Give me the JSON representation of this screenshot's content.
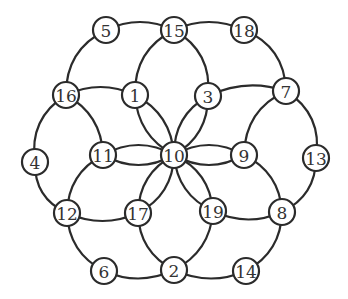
{
  "diagram": {
    "type": "graph",
    "node_radius": 13,
    "colors": {
      "stroke": "#2b2b2b",
      "fill": "#ffffff",
      "label": "#333333"
    },
    "nodes": [
      {
        "id": "1",
        "x": 135,
        "y": 95
      },
      {
        "id": "2",
        "x": 174,
        "y": 270
      },
      {
        "id": "3",
        "x": 208,
        "y": 96
      },
      {
        "id": "4",
        "x": 35,
        "y": 162
      },
      {
        "id": "5",
        "x": 106,
        "y": 30
      },
      {
        "id": "6",
        "x": 104,
        "y": 271
      },
      {
        "id": "7",
        "x": 286,
        "y": 91
      },
      {
        "id": "8",
        "x": 282,
        "y": 212
      },
      {
        "id": "9",
        "x": 244,
        "y": 155
      },
      {
        "id": "10",
        "x": 174,
        "y": 155
      },
      {
        "id": "11",
        "x": 103,
        "y": 155
      },
      {
        "id": "12",
        "x": 67,
        "y": 213
      },
      {
        "id": "13",
        "x": 316,
        "y": 158
      },
      {
        "id": "14",
        "x": 246,
        "y": 271
      },
      {
        "id": "15",
        "x": 174,
        "y": 30
      },
      {
        "id": "16",
        "x": 66,
        "y": 95
      },
      {
        "id": "17",
        "x": 138,
        "y": 213
      },
      {
        "id": "18",
        "x": 244,
        "y": 30
      },
      {
        "id": "19",
        "x": 213,
        "y": 211
      }
    ],
    "edges": [
      {
        "from": "5",
        "to": "15",
        "bend": -8
      },
      {
        "from": "15",
        "to": "18",
        "bend": -8
      },
      {
        "from": "5",
        "to": "16",
        "bend": 12
      },
      {
        "from": "15",
        "to": "1",
        "bend": 12
      },
      {
        "from": "15",
        "to": "3",
        "bend": -12
      },
      {
        "from": "18",
        "to": "7",
        "bend": -12
      },
      {
        "from": "16",
        "to": "1",
        "bend": -8
      },
      {
        "from": "3",
        "to": "7",
        "bend": -8
      },
      {
        "from": "16",
        "to": "4",
        "bend": 12
      },
      {
        "from": "16",
        "to": "11",
        "bend": -10
      },
      {
        "from": "7",
        "to": "13",
        "bend": -12
      },
      {
        "from": "7",
        "to": "9",
        "bend": 12
      },
      {
        "from": "1",
        "to": "10",
        "bend": 10
      },
      {
        "from": "1",
        "to": "10",
        "bend": -10
      },
      {
        "from": "3",
        "to": "10",
        "bend": 10
      },
      {
        "from": "3",
        "to": "10",
        "bend": -10
      },
      {
        "from": "11",
        "to": "10",
        "bend": 10
      },
      {
        "from": "11",
        "to": "10",
        "bend": -10
      },
      {
        "from": "9",
        "to": "10",
        "bend": 10
      },
      {
        "from": "9",
        "to": "10",
        "bend": -10
      },
      {
        "from": "17",
        "to": "10",
        "bend": 10
      },
      {
        "from": "17",
        "to": "10",
        "bend": -10
      },
      {
        "from": "19",
        "to": "10",
        "bend": 10
      },
      {
        "from": "19",
        "to": "10",
        "bend": -10
      },
      {
        "from": "4",
        "to": "12",
        "bend": 10
      },
      {
        "from": "11",
        "to": "12",
        "bend": 10
      },
      {
        "from": "12",
        "to": "17",
        "bend": 8
      },
      {
        "from": "12",
        "to": "6",
        "bend": 10
      },
      {
        "from": "13",
        "to": "8",
        "bend": -10
      },
      {
        "from": "9",
        "to": "8",
        "bend": -10
      },
      {
        "from": "19",
        "to": "8",
        "bend": 8
      },
      {
        "from": "8",
        "to": "14",
        "bend": -10
      },
      {
        "from": "17",
        "to": "2",
        "bend": 10
      },
      {
        "from": "19",
        "to": "2",
        "bend": -10
      },
      {
        "from": "6",
        "to": "2",
        "bend": 8
      },
      {
        "from": "2",
        "to": "14",
        "bend": 8
      }
    ]
  }
}
